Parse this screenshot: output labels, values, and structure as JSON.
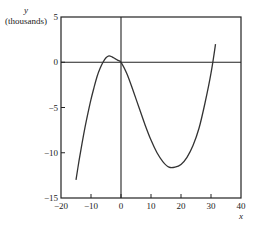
{
  "chart_data": {
    "type": "line",
    "title": "",
    "xlabel": "x",
    "ylabel": "y",
    "ylabel_unit": "(thousands)",
    "xlim": [
      -20,
      40
    ],
    "ylim": [
      -15,
      5
    ],
    "x_ticks": [
      -20,
      -10,
      0,
      10,
      20,
      30,
      40
    ],
    "x_tick_labels": [
      "−20",
      "−10",
      "0",
      "10",
      "20",
      "30",
      "40"
    ],
    "y_ticks": [
      5,
      0,
      -5,
      -10,
      -15
    ],
    "y_tick_labels": [
      "5",
      "0",
      "−5",
      "−10",
      "−15"
    ],
    "grid": false,
    "reference_lines": {
      "x_zero": true,
      "y_zero": true
    },
    "series": [
      {
        "name": "y",
        "x": [
          -15,
          -14,
          -13,
          -12,
          -11,
          -10,
          -9,
          -8,
          -7,
          -6,
          -5,
          -4,
          -3,
          -2,
          -1,
          0,
          2,
          4,
          6,
          8,
          10,
          12,
          14,
          16,
          18,
          20,
          22,
          24,
          26,
          28,
          30,
          31.5
        ],
        "y": [
          -13.0,
          -10.9,
          -9.0,
          -7.2,
          -5.6,
          -4.1,
          -2.8,
          -1.6,
          -0.7,
          0.0,
          0.5,
          0.7,
          0.6,
          0.4,
          0.2,
          0.0,
          -1.3,
          -3.1,
          -5.0,
          -6.9,
          -8.6,
          -10.0,
          -11.0,
          -11.6,
          -11.6,
          -11.3,
          -10.5,
          -9.2,
          -7.3,
          -4.5,
          -1.2,
          2.0
        ]
      }
    ],
    "colors": {
      "line": "#333333",
      "axes": "#222222"
    }
  }
}
